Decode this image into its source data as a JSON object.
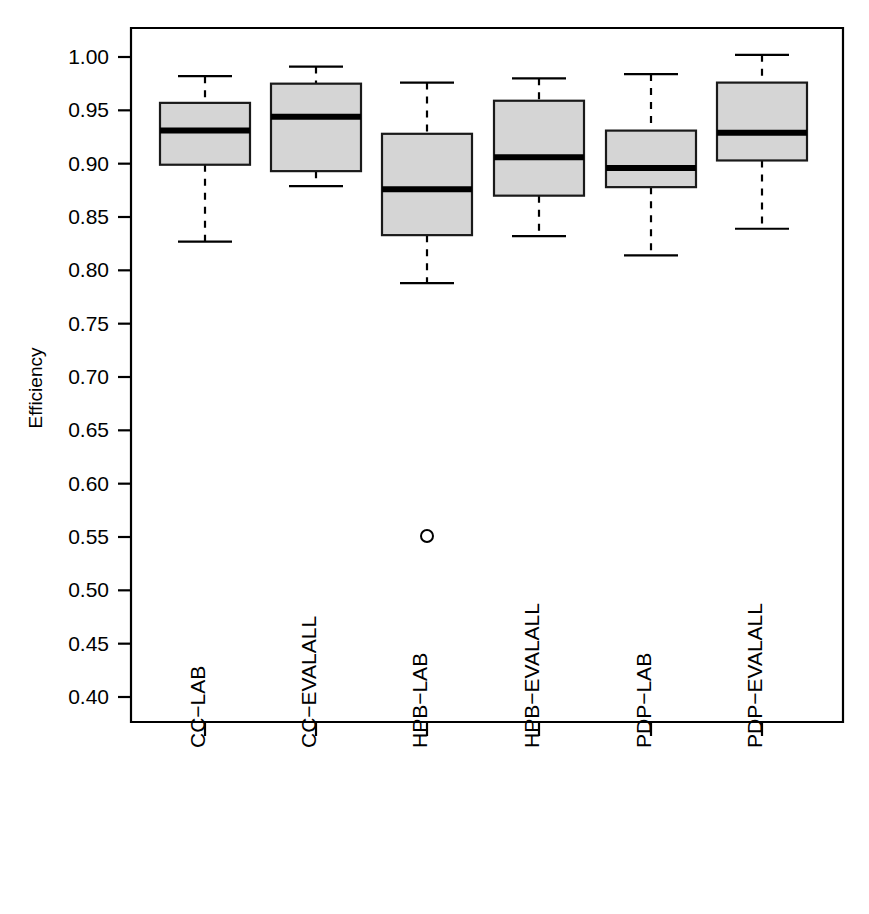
{
  "chart_data": {
    "type": "box",
    "title": "",
    "xlabel": "",
    "ylabel": "Efficiency",
    "ylim": [
      0.385,
      1.022
    ],
    "grid": false,
    "legend": null,
    "categories": [
      "CC−LAB",
      "CC−EVALALL",
      "HPB−LAB",
      "HPB−EVALALL",
      "PDP−LAB",
      "PDP−EVALALL"
    ],
    "ytick_labels": [
      "1.00",
      "0.95",
      "0.90",
      "0.85",
      "0.80",
      "0.75",
      "0.70",
      "0.65",
      "0.60",
      "0.55",
      "0.50",
      "0.45",
      "0.40"
    ],
    "ytick_values": [
      1.0,
      0.95,
      0.9,
      0.85,
      0.8,
      0.75,
      0.7,
      0.65,
      0.6,
      0.55,
      0.5,
      0.45,
      0.4
    ],
    "boxes": [
      {
        "label": "CC−LAB",
        "whisker_low": 0.827,
        "q1": 0.899,
        "median": 0.931,
        "q3": 0.957,
        "whisker_high": 0.982,
        "outliers": []
      },
      {
        "label": "CC−EVALALL",
        "whisker_low": 0.879,
        "q1": 0.893,
        "median": 0.944,
        "q3": 0.975,
        "whisker_high": 0.991,
        "outliers": []
      },
      {
        "label": "HPB−LAB",
        "whisker_low": 0.788,
        "q1": 0.833,
        "median": 0.876,
        "q3": 0.928,
        "whisker_high": 0.976,
        "outliers": [
          0.551
        ]
      },
      {
        "label": "HPB−EVALALL",
        "whisker_low": 0.832,
        "q1": 0.87,
        "median": 0.906,
        "q3": 0.959,
        "whisker_high": 0.98,
        "outliers": []
      },
      {
        "label": "PDP−LAB",
        "whisker_low": 0.814,
        "q1": 0.878,
        "median": 0.896,
        "q3": 0.931,
        "whisker_high": 0.984,
        "outliers": []
      },
      {
        "label": "PDP−EVALALL",
        "whisker_low": 0.839,
        "q1": 0.903,
        "median": 0.929,
        "q3": 0.976,
        "whisker_high": 1.002,
        "outliers": []
      }
    ],
    "colors": {
      "box_fill": "#d5d5d5",
      "box_border": "#1a1a1a",
      "median": "#000000",
      "whisker": "#000000",
      "axis": "#000000",
      "background": "#ffffff"
    }
  }
}
